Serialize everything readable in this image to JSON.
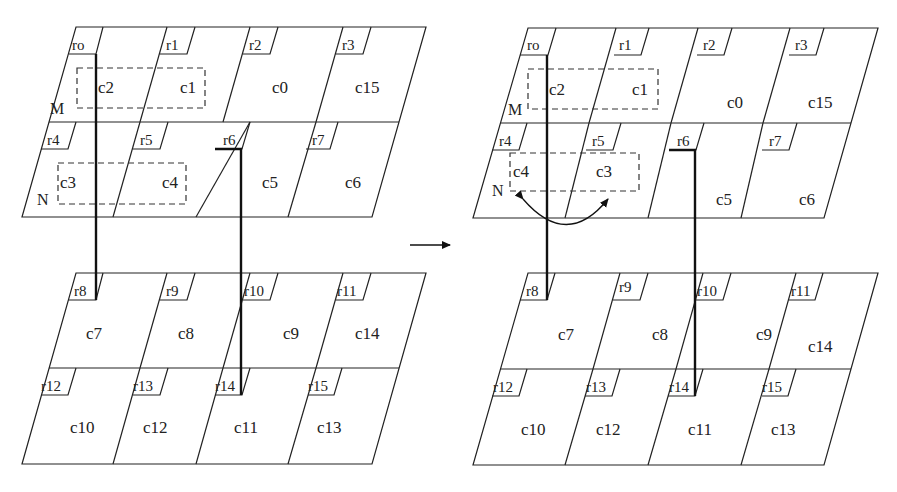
{
  "diagram": {
    "transition_arrow": "right-arrow",
    "before": {
      "top_layer": {
        "registers": [
          "ro",
          "r1",
          "r2",
          "r3",
          "r4",
          "r5",
          "r6",
          "r7"
        ],
        "row1_cells": [
          "c2",
          "c1",
          "c0",
          "c15"
        ],
        "row2_cells": [
          "c3",
          "c4",
          "c5",
          "c6"
        ],
        "group_labels": {
          "m": "M",
          "n": "N"
        }
      },
      "bottom_layer": {
        "registers": [
          "r8",
          "r9",
          "r10",
          "r11",
          "r12",
          "r13",
          "r14",
          "r15"
        ],
        "row1_cells": [
          "c7",
          "c8",
          "c9",
          "c14"
        ],
        "row2_cells": [
          "c10",
          "c12",
          "c11",
          "c13"
        ]
      }
    },
    "after": {
      "top_layer": {
        "registers": [
          "ro",
          "r1",
          "r2",
          "r3",
          "r4",
          "r5",
          "r6",
          "r7"
        ],
        "row1_cells": [
          "c2",
          "c1",
          "c0",
          "c15"
        ],
        "row2_cells": [
          "c4",
          "c3",
          "c5",
          "c6"
        ],
        "group_labels": {
          "m": "M",
          "n": "N"
        }
      },
      "bottom_layer": {
        "registers": [
          "r8",
          "r9",
          "r10",
          "r11",
          "r12",
          "r13",
          "r14",
          "r15"
        ],
        "row1_cells": [
          "c7",
          "c8",
          "c9",
          "c14"
        ],
        "row2_cells": [
          "c10",
          "c12",
          "c11",
          "c13"
        ]
      },
      "swap_arrow": "double-headed curved arrow between c4 and c3"
    }
  }
}
